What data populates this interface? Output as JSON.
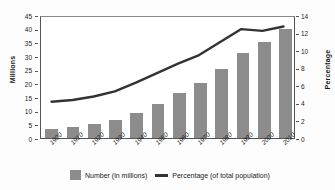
{
  "chart_data": {
    "type": "bar",
    "title": "",
    "subtitle": "",
    "xlabel": "",
    "ylabel": "Millions",
    "ylabel_secondary": "Percentage",
    "categories": [
      "1900",
      "1910",
      "1920",
      "1930",
      "1940",
      "1950",
      "1960",
      "1970",
      "1980",
      "1990",
      "2000",
      "2010"
    ],
    "ylim": [
      0,
      45
    ],
    "ylim_secondary": [
      0,
      14
    ],
    "yticks": [
      0,
      5,
      10,
      15,
      20,
      25,
      30,
      35,
      40,
      45
    ],
    "yticks_secondary": [
      0,
      2,
      4,
      6,
      8,
      10,
      12,
      14
    ],
    "grid": false,
    "legend_position": "bottom",
    "series": [
      {
        "name": "Number (in millions)",
        "type": "bar",
        "axis": "left",
        "color": "#8c8c8c",
        "values": [
          3.2,
          3.9,
          5.0,
          6.7,
          9.0,
          12.3,
          16.6,
          20.0,
          25.4,
          31.0,
          35.0,
          40.0
        ]
      },
      {
        "name": "Percentage (of total population)",
        "type": "line",
        "axis": "right",
        "color": "#333333",
        "values": [
          4.2,
          4.4,
          4.8,
          5.4,
          6.4,
          7.5,
          8.6,
          9.6,
          11.1,
          12.6,
          12.4,
          12.9
        ]
      }
    ]
  },
  "legend": {
    "bar_label": "Number (in millions)",
    "line_label": "Percentage (of total population)"
  },
  "colors": {
    "bar": "#8c8c8c",
    "line": "#333333",
    "axis": "#555555",
    "background": "#ffffff"
  }
}
